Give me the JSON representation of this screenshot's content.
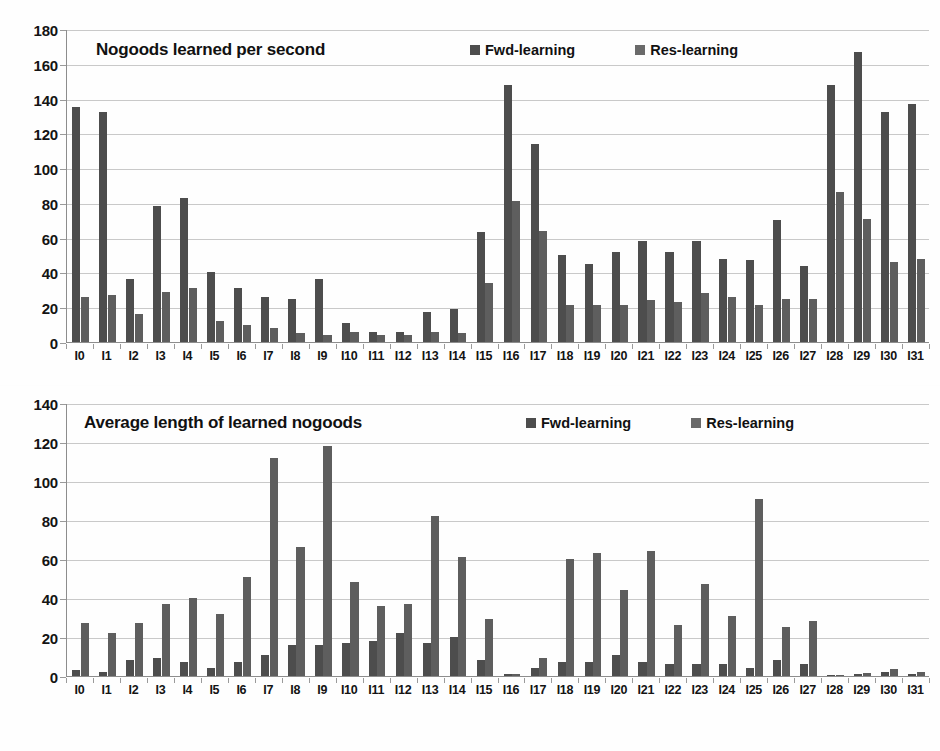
{
  "figure": {
    "background": "#fdfdfd",
    "bar_color_fwd": "#4d4d4d",
    "bar_color_res": "#5e5e5e",
    "gridline_color": "#c9c9c9",
    "axis_color": "#8d8d8d"
  },
  "chart_data": [
    {
      "type": "bar",
      "title": "Nogoods learned per second",
      "xlabel": "",
      "ylabel": "",
      "ylim": [
        0,
        180
      ],
      "yticks": [
        0,
        20,
        40,
        60,
        80,
        100,
        120,
        140,
        160,
        180
      ],
      "grid": true,
      "legend_position": "top-center",
      "categories": [
        "I0",
        "I1",
        "I2",
        "I3",
        "I4",
        "I5",
        "I6",
        "I7",
        "I8",
        "I9",
        "I10",
        "I11",
        "I12",
        "I13",
        "I14",
        "I15",
        "I16",
        "I17",
        "I18",
        "I19",
        "I20",
        "I21",
        "I22",
        "I23",
        "I24",
        "I25",
        "I26",
        "I27",
        "I28",
        "I29",
        "I30",
        "I31"
      ],
      "series": [
        {
          "name": "Fwd-learning",
          "values": [
            135,
            132,
            36,
            78,
            83,
            40,
            31,
            26,
            25,
            36,
            11,
            6,
            6,
            17,
            19,
            63,
            148,
            114,
            50,
            45,
            52,
            58,
            52,
            58,
            48,
            47,
            70,
            44,
            148,
            167,
            132,
            137
          ]
        },
        {
          "name": "Res-learning",
          "values": [
            26,
            27,
            16,
            29,
            31,
            12,
            10,
            8,
            5,
            4,
            6,
            4,
            4,
            6,
            5,
            34,
            81,
            64,
            21,
            21,
            21,
            24,
            23,
            28,
            26,
            21,
            25,
            25,
            86,
            71,
            46,
            48
          ]
        }
      ]
    },
    {
      "type": "bar",
      "title": "Average length of learned nogoods",
      "xlabel": "",
      "ylabel": "",
      "ylim": [
        0,
        140
      ],
      "yticks": [
        0,
        20,
        40,
        60,
        80,
        100,
        120,
        140
      ],
      "grid": true,
      "legend_position": "top-center",
      "categories": [
        "I0",
        "I1",
        "I2",
        "I3",
        "I4",
        "I5",
        "I6",
        "I7",
        "I8",
        "I9",
        "I10",
        "I11",
        "I12",
        "I13",
        "I14",
        "I15",
        "I16",
        "I17",
        "I18",
        "I19",
        "I20",
        "I21",
        "I22",
        "I23",
        "I24",
        "I25",
        "I26",
        "I27",
        "I28",
        "I29",
        "I30",
        "I31"
      ],
      "series": [
        {
          "name": "Fwd-learning",
          "values": [
            3,
            2,
            8,
            9,
            7,
            4,
            7,
            11,
            16,
            16,
            17,
            18,
            22,
            17,
            20,
            8,
            1,
            4,
            7,
            7,
            11,
            7,
            6,
            6,
            6,
            4,
            8,
            6,
            0.5,
            1,
            2,
            1
          ]
        },
        {
          "name": "Res-learning",
          "values": [
            27,
            22,
            27,
            37,
            40,
            32,
            51,
            112,
            66,
            118,
            48,
            36,
            37,
            82,
            61,
            29,
            1,
            9,
            60,
            63,
            44,
            64,
            26,
            47,
            31,
            91,
            25,
            28,
            0.5,
            1.5,
            3.5,
            2
          ]
        }
      ]
    }
  ],
  "legend": {
    "fwd_label": "Fwd-learning",
    "res_label": "Res-learning"
  }
}
